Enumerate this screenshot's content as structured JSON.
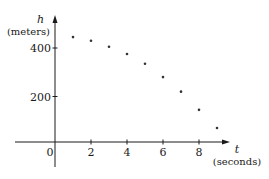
{
  "chart_data": {
    "type": "scatter",
    "title": "",
    "xlabel_var": "t",
    "xlabel_unit": "(seconds)",
    "ylabel_var": "h",
    "ylabel_unit": "(meters)",
    "x_ticks": [
      2,
      4,
      6,
      8
    ],
    "y_ticks": [
      200,
      400
    ],
    "origin_label": "0",
    "xlim": [
      -2.5,
      10.5
    ],
    "ylim": [
      -50,
      520
    ],
    "grid": false,
    "legend": null,
    "series": [
      {
        "name": "height",
        "x": [
          1,
          2,
          3,
          4,
          5,
          6,
          7,
          8,
          9
        ],
        "y": [
          445,
          430,
          405,
          375,
          335,
          280,
          220,
          145,
          70
        ]
      }
    ]
  },
  "colors": {
    "axis": "#1a1a1a",
    "point": "#333333",
    "background": "#ffffff"
  }
}
